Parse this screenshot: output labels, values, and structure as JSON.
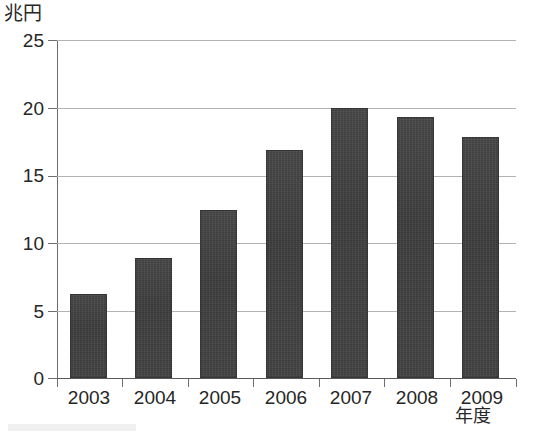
{
  "chart_data": {
    "type": "bar",
    "title": "",
    "unit_label": "兆円",
    "xlabel": "年度",
    "ylabel": "兆円",
    "categories": [
      "2003",
      "2004",
      "2005",
      "2006",
      "2007",
      "2008",
      "2009"
    ],
    "values": [
      6.2,
      8.9,
      12.4,
      16.9,
      20.0,
      19.3,
      17.8
    ],
    "ylim": [
      0,
      25
    ],
    "ytick_labels": [
      "0",
      "5",
      "10",
      "15",
      "20",
      "25"
    ],
    "ytick_values": [
      0,
      5,
      10,
      15,
      20,
      25
    ],
    "grid": true,
    "grid_axis": "y",
    "legend": false,
    "bar_color": "#3b3b3b",
    "grid_color": "#b3b3b3",
    "axis_color": "#6e6e6e",
    "text_color": "#262626"
  }
}
